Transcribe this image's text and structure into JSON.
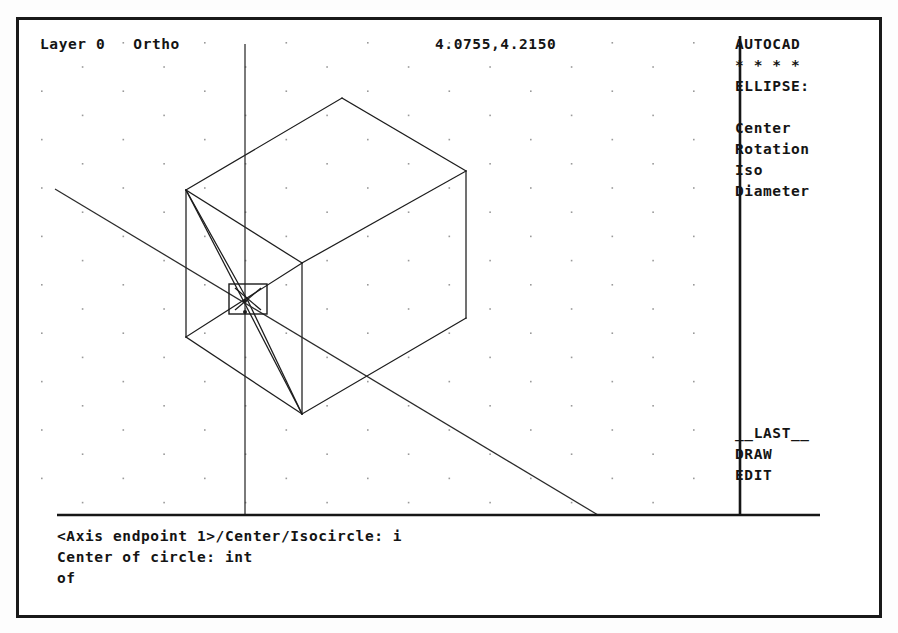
{
  "app": {
    "name": "AutoCAD",
    "screen_width": 898,
    "screen_height": 633,
    "background_color": "#ffffff",
    "foreground_color": "#141414"
  },
  "status_bar": {
    "layer_text": "Layer 0   Ortho",
    "coordinates": "4.0755,4.2150"
  },
  "side_menu": {
    "title": "AUTOCAD",
    "separator": "* * * *",
    "command_heading": "ELLIPSE:",
    "options": [
      {
        "label": "Center"
      },
      {
        "label": "Rotation"
      },
      {
        "label": "Iso"
      },
      {
        "label": "Diameter"
      }
    ],
    "footer": [
      {
        "label": "__LAST__"
      },
      {
        "label": "DRAW"
      },
      {
        "label": "EDIT"
      }
    ]
  },
  "command_area": {
    "lines": [
      "<Axis endpoint 1>/Center/Isocircle: i",
      "Center of circle: int",
      "of"
    ]
  },
  "drawing": {
    "grid_style": "isometric-dots",
    "snap_mode": "Ortho",
    "osnap_mode": "int",
    "crosshair": {
      "vertical_x": 226,
      "iso_line_from": "36,169",
      "iso_line_to": "579,495"
    },
    "aperture_box": {
      "x": 210,
      "y": 264,
      "width": 38,
      "height": 30
    },
    "box_vertices": {
      "top": "323,78",
      "top_left": "167,170",
      "top_mid": "283,243",
      "top_right": "447,151",
      "bottom_left": "167,317",
      "bottom_mid": "283,394",
      "bottom_right": "447,298"
    }
  }
}
